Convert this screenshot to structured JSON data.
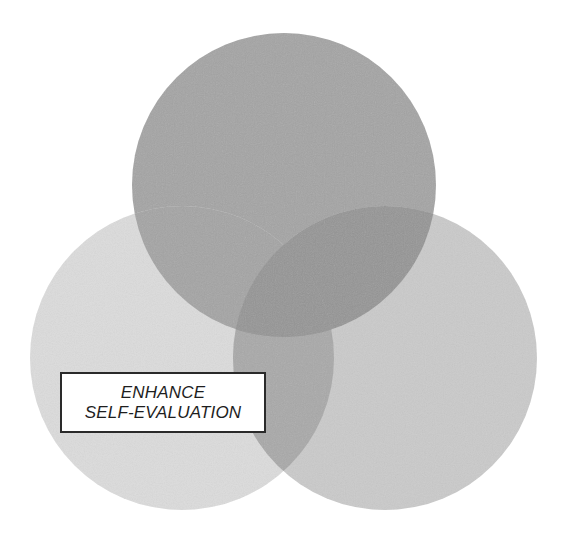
{
  "diagram": {
    "type": "venn",
    "circles": [
      {
        "id": "top",
        "cx": 284,
        "cy": 185,
        "r": 152,
        "fill": "#a4a4a4",
        "label": ""
      },
      {
        "id": "left",
        "cx": 182,
        "cy": 358,
        "r": 152,
        "fill": "#dcdcdc",
        "label": "ENHANCE SELF-EVALUATION"
      },
      {
        "id": "right",
        "cx": 385,
        "cy": 358,
        "r": 152,
        "fill": "#cacaca",
        "label": ""
      }
    ],
    "overlap_colors": {
      "top_right": "#959595",
      "left_right": "#a9a9a9",
      "top_left": "#a4a4a4"
    },
    "label": {
      "line1": "ENHANCE",
      "line2": "SELF-EVALUATION"
    }
  }
}
